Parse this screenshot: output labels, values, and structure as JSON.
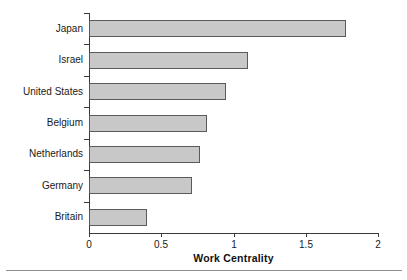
{
  "chart_data": {
    "type": "bar",
    "orientation": "horizontal",
    "title": "",
    "xlabel": "Work Centrality",
    "ylabel": "",
    "xlim": [
      0,
      2
    ],
    "xticks": [
      "0",
      "0.5",
      "1",
      "1.5",
      "2"
    ],
    "xtick_values": [
      0,
      0.5,
      1,
      1.5,
      2
    ],
    "grid": false,
    "legend": false,
    "bar_fill_color": "#c8c8c8",
    "bar_edge_color": "#5a5a5a",
    "axis_color": "#3a3a3a",
    "background_color": "#ffffff",
    "categories": [
      "Japan",
      "Israel",
      "United States",
      "Belgium",
      "Netherlands",
      "Germany",
      "Britain"
    ],
    "values": [
      1.78,
      1.1,
      0.95,
      0.82,
      0.77,
      0.71,
      0.4
    ],
    "bars": [
      {
        "label": "Japan",
        "value": 1.78
      },
      {
        "label": "Israel",
        "value": 1.1
      },
      {
        "label": "United States",
        "value": 0.95
      },
      {
        "label": "Belgium",
        "value": 0.82
      },
      {
        "label": "Netherlands",
        "value": 0.77
      },
      {
        "label": "Germany",
        "value": 0.71
      },
      {
        "label": "Britain",
        "value": 0.4
      }
    ]
  }
}
